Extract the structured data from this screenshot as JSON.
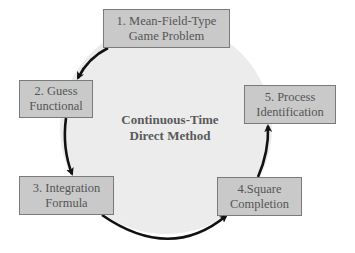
{
  "diagram": {
    "type": "cycle",
    "center": {
      "line1": "Continuous-Time",
      "line2": "Direct Method"
    },
    "nodes": [
      {
        "id": 1,
        "line1": "1. Mean-Field-Type",
        "line2": "Game Problem"
      },
      {
        "id": 2,
        "line1": "2. Guess",
        "line2": "Functional"
      },
      {
        "id": 3,
        "line1": "3. Integration",
        "line2": "Formula"
      },
      {
        "id": 4,
        "line1": "4.Square",
        "line2": "Completion"
      },
      {
        "id": 5,
        "line1": "5. Process",
        "line2": "Identification"
      }
    ],
    "edges": [
      {
        "from": 1,
        "to": 2
      },
      {
        "from": 2,
        "to": 3
      },
      {
        "from": 3,
        "to": 4
      },
      {
        "from": 4,
        "to": 5
      }
    ],
    "colors": {
      "circle_fill": "#ececec",
      "node_fill": "#c9c9c9",
      "node_border": "#7a7a7a",
      "text": "#555555",
      "arrow": "#111111"
    }
  }
}
